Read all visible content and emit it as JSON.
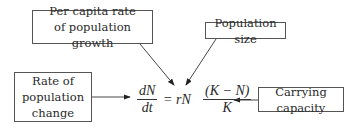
{
  "diagram": {
    "labels": {
      "per_capita": "Per capita rate of population growth",
      "pop_size": "Population size",
      "rate_change": "Rate of population change",
      "carrying_capacity": "Carrying capacity"
    },
    "equation": {
      "lhs_num": "dN",
      "lhs_den": "dt",
      "middle": "= rN",
      "rhs_num": "(K − N)",
      "rhs_den": "K"
    },
    "arrows": [
      {
        "from": "per_capita",
        "to": "r"
      },
      {
        "from": "pop_size",
        "to": "N"
      },
      {
        "from": "rate_change",
        "to": "dN/dt"
      },
      {
        "from": "carrying_capacity",
        "to": "K"
      }
    ],
    "colors": {
      "line": "#333333",
      "border": "#555555",
      "text": "#2a2a2a"
    }
  }
}
